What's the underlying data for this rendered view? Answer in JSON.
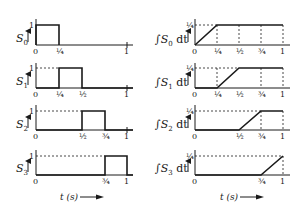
{
  "left_column": {
    "panels": [
      {
        "label": "S",
        "sub": "0",
        "top_tick": "1",
        "x_ticks": [
          "0",
          "¼",
          "1"
        ],
        "pulse": [
          0,
          0.25
        ]
      },
      {
        "label": "S",
        "sub": "1",
        "top_tick": "1",
        "x_ticks": [
          "0",
          "¼",
          "½",
          "1"
        ],
        "pulse": [
          0.25,
          0.5
        ]
      },
      {
        "label": "S",
        "sub": "2",
        "top_tick": "1",
        "x_ticks": [
          "0",
          "½",
          "¾",
          "1"
        ],
        "pulse": [
          0.5,
          0.75
        ]
      },
      {
        "label": "S",
        "sub": "3",
        "top_tick": "1",
        "x_ticks": [
          "0",
          "¾",
          "1"
        ],
        "pulse": [
          0.75,
          1
        ]
      }
    ],
    "time_label": "t (s)"
  },
  "right_column": {
    "panels": [
      {
        "label_prefix": "∫S",
        "sub": "0",
        "label_suffix": " dt",
        "top_tick": "¼",
        "x_ticks": [
          "0",
          "¼",
          "½",
          "¾",
          "1"
        ],
        "ramp": [
          0,
          0.25
        ]
      },
      {
        "label_prefix": "∫S",
        "sub": "1",
        "label_suffix": " dt",
        "top_tick": "¼",
        "x_ticks": [
          "0",
          "¼",
          "½",
          "¾",
          "1"
        ],
        "ramp": [
          0.25,
          0.5
        ]
      },
      {
        "label_prefix": "∫S",
        "sub": "2",
        "label_suffix": " dt",
        "top_tick": "¼",
        "x_ticks": [
          "0",
          "½",
          "¾",
          "1"
        ],
        "ramp": [
          0.5,
          0.75
        ]
      },
      {
        "label_prefix": "∫S",
        "sub": "3",
        "label_suffix": " dt",
        "top_tick": "¼",
        "x_ticks": [
          "0",
          "¾",
          "1"
        ],
        "ramp": [
          0.75,
          1
        ]
      }
    ],
    "time_label": "t (s)"
  }
}
